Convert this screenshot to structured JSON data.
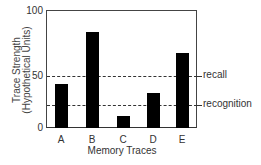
{
  "chart_data": {
    "type": "bar",
    "title": "",
    "xlabel": "Memory Traces",
    "ylabel": "Trace Strength (Hypothetical Units)",
    "ylabel_lines": [
      "Trace Strength",
      "(Hypothetical Units)"
    ],
    "categories": [
      "A",
      "B",
      "C",
      "D",
      "E"
    ],
    "values": [
      42,
      84,
      12,
      34,
      68
    ],
    "ylim": [
      0,
      100
    ],
    "yticks": [
      0,
      50,
      100
    ],
    "grid": false,
    "legend": null,
    "bar_color": "#000000",
    "thresholds": [
      {
        "label": "recall",
        "value": 50,
        "style": "dashed"
      },
      {
        "label": "recognition",
        "value": 22,
        "style": "dashed"
      }
    ]
  }
}
